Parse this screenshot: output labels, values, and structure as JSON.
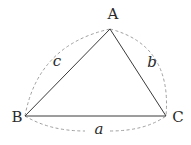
{
  "diagram": {
    "type": "triangle",
    "vertices": [
      {
        "id": "A",
        "label": "A",
        "x": 110,
        "y": 29
      },
      {
        "id": "B",
        "label": "B",
        "x": 25,
        "y": 116
      },
      {
        "id": "C",
        "label": "C",
        "x": 166,
        "y": 116
      }
    ],
    "sides": [
      {
        "id": "a",
        "label": "a",
        "from": "B",
        "to": "C"
      },
      {
        "id": "b",
        "label": "b",
        "from": "A",
        "to": "C"
      },
      {
        "id": "c",
        "label": "c",
        "from": "A",
        "to": "B"
      }
    ],
    "colors": {
      "edge": "#333333",
      "arc": "#9a9a9a",
      "text": "#2a2a2a"
    }
  }
}
